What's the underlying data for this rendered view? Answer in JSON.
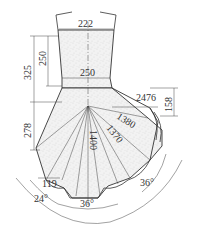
{
  "diagram": {
    "type": "engineering-section-drawing",
    "dimensions": {
      "top_width": "222",
      "neck_width": "250",
      "upper_height": "325",
      "neck_height": "250",
      "lower_height": "278",
      "branch_length": "2476",
      "branch_offset": "158",
      "radius_1": "1380",
      "radius_2": "1370",
      "radius_3": "1400",
      "base_offset": "119",
      "angle_left": "24°",
      "angle_bottom": "36°",
      "angle_right": "36°"
    },
    "colors": {
      "line": "#333333",
      "fill": "#ececec",
      "background": "#ffffff"
    }
  }
}
